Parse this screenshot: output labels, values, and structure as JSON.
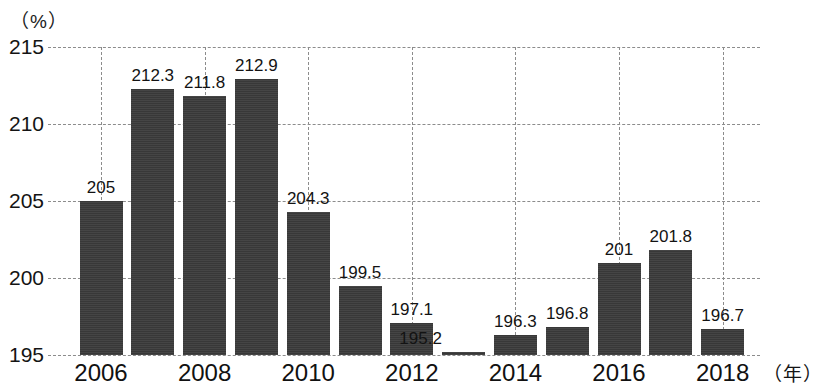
{
  "chart_data": {
    "type": "bar",
    "title": "",
    "subtitle": "",
    "xlabel": "（年）",
    "ylabel": "（%）",
    "categories": [
      "2006",
      "2007",
      "2008",
      "2009",
      "2010",
      "2011",
      "2012",
      "2013",
      "2014",
      "2015",
      "2016",
      "2017",
      "2018"
    ],
    "values": [
      205,
      212.3,
      211.8,
      212.9,
      204.3,
      199.5,
      197.1,
      195.2,
      196.3,
      196.8,
      201,
      201.8,
      196.7
    ],
    "data_labels": [
      "205",
      "212.3",
      "211.8",
      "212.9",
      "204.3",
      "199.5",
      "197.1",
      "195.2",
      "196.3",
      "196.8",
      "201",
      "201.8",
      "196.7"
    ],
    "xtick_labels": [
      "2006",
      "2008",
      "2010",
      "2012",
      "2014",
      "2016",
      "2018"
    ],
    "xtick_categories": [
      "2006",
      "2008",
      "2010",
      "2012",
      "2014",
      "2016",
      "2018"
    ],
    "ytick_labels": [
      "215",
      "210",
      "205",
      "200",
      "195"
    ],
    "ytick_values": [
      215,
      210,
      205,
      200,
      195
    ],
    "ylim": [
      195,
      215
    ],
    "grid": "dashed-both",
    "legend": "none",
    "bar_color": "#3b3b3b",
    "grid_color": "#8c8c8c",
    "background_color": "#ffffff"
  }
}
